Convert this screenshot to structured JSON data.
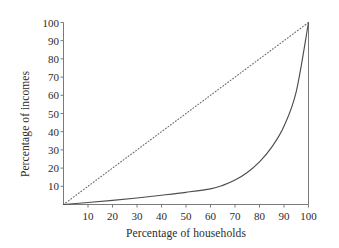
{
  "chart_data": {
    "type": "line",
    "title": "",
    "xlabel": "Percentage of households",
    "ylabel": "Percentage of incomes",
    "xlim": [
      0,
      100
    ],
    "ylim": [
      0,
      100
    ],
    "xticks": [
      10,
      20,
      30,
      40,
      50,
      60,
      70,
      80,
      90,
      100
    ],
    "yticks": [
      10,
      20,
      30,
      40,
      50,
      60,
      70,
      80,
      90,
      100
    ],
    "grid": false,
    "legend": null,
    "axis_color": "#7a7a7a",
    "series": [
      {
        "name": "Line of equality",
        "style": "dotted",
        "color": "#6b6b6b",
        "x": [
          0,
          10,
          20,
          30,
          40,
          50,
          60,
          70,
          80,
          90,
          100
        ],
        "values": [
          0,
          10,
          20,
          30,
          40,
          50,
          60,
          70,
          80,
          90,
          100
        ]
      },
      {
        "name": "Lorenz curve",
        "style": "solid",
        "color": "#4d4d4d",
        "x": [
          0,
          10,
          20,
          30,
          40,
          50,
          60,
          65,
          70,
          75,
          80,
          85,
          90,
          95,
          100
        ],
        "values": [
          0,
          1.1,
          2.3,
          3.6,
          5.1,
          6.7,
          8.6,
          10.5,
          13.4,
          17.6,
          23.4,
          31.5,
          43.0,
          62.0,
          100.0
        ]
      }
    ],
    "annotations": []
  },
  "axis_titles": {
    "x": "Percentage of households",
    "y": "Percentage of incomes"
  }
}
